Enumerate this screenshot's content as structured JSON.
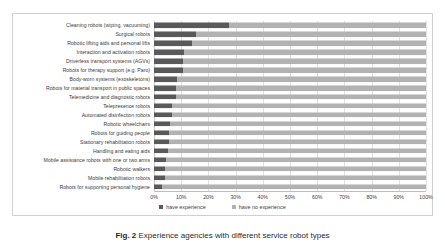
{
  "figure": {
    "caption_label": "Fig. 2",
    "caption_text": "Experience agencies with different service robot types"
  },
  "legend": {
    "position": "bottom-center",
    "items": [
      {
        "label": "have experience",
        "color": "#595959",
        "key": "experience"
      },
      {
        "label": "have no experience",
        "color": "#b2b2b2",
        "key": "no_experience"
      }
    ]
  },
  "axis": {
    "ticks": [
      "0%",
      "10%",
      "20%",
      "30%",
      "40%",
      "50%",
      "60%",
      "70%",
      "80%",
      "90%",
      "100%"
    ],
    "tick_values": [
      0,
      10,
      20,
      30,
      40,
      50,
      60,
      70,
      80,
      90,
      100
    ]
  },
  "chart_data": {
    "type": "bar",
    "orientation": "horizontal",
    "stacked": true,
    "title": "",
    "xlabel": "",
    "ylabel": "",
    "xlim": [
      0,
      100
    ],
    "grid": true,
    "legend_position": "bottom-center",
    "categories": [
      "Cleaning robots (wiping, vacuuming)",
      "Surgical robots",
      "Robotic lifting aids and personal lifts",
      "Interaction and activation robots",
      "Driverless transport systems (AGVs)",
      "Robots for therapy support (e.g. Paro)",
      "Body-worn systems (exoskeletons)",
      "Robots for material transport in public spaces",
      "Telemedicine and diagnostic robots",
      "Telepresence robots",
      "Automated disinfection robots",
      "Robotic wheelchairs",
      "Robots for guiding people",
      "Stationary rehabilitation robots",
      "Handling and eating aids",
      "Mobile assistance robots with one or two arms",
      "Robotic walkers",
      "Mobile rehabilitation robots",
      "Robots for supporting personal hygiene"
    ],
    "series": [
      {
        "name": "have experience",
        "color": "#595959",
        "values": [
          27.5,
          15.5,
          14.0,
          11.0,
          10.5,
          10.5,
          8.5,
          8.0,
          8.0,
          6.5,
          6.5,
          6.0,
          5.5,
          5.5,
          5.0,
          4.5,
          4.0,
          4.0,
          3.0
        ]
      },
      {
        "name": "have no experience",
        "color": "#b2b2b2",
        "values": [
          72.5,
          84.5,
          86.0,
          89.0,
          89.5,
          89.5,
          91.5,
          92.0,
          92.0,
          93.5,
          93.5,
          94.0,
          94.5,
          94.5,
          95.0,
          95.5,
          96.0,
          96.0,
          97.0
        ]
      }
    ]
  }
}
